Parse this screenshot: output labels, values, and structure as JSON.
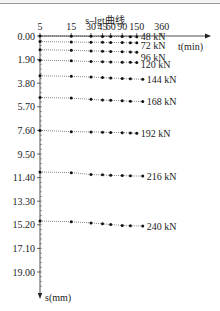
{
  "chart_data": {
    "type": "line",
    "title": "s–lgt曲线",
    "xlabel": "t(min)",
    "ylabel": "s(mm)",
    "x_scale": "log",
    "x_ticks": [
      5,
      15,
      30,
      45,
      60,
      90,
      150,
      360
    ],
    "x_tick_labels": [
      "5",
      "15",
      "30",
      "45",
      "60",
      "90",
      "150",
      "360"
    ],
    "y_ticks": [
      0.0,
      1.9,
      3.8,
      5.7,
      7.6,
      9.5,
      11.4,
      13.3,
      15.2,
      17.1,
      19.0
    ],
    "y_tick_labels": [
      "0.00",
      "1.90",
      "3.80",
      "5.70",
      "7.60",
      "9.50",
      "11.40",
      "13.30",
      "15.20",
      "17.10",
      "19.00"
    ],
    "ylim": [
      0,
      20.5
    ],
    "y_inverted": true,
    "grid": false,
    "x": [
      5,
      15,
      30,
      45,
      60,
      90,
      120,
      150
    ],
    "series": [
      {
        "name": "48 kN",
        "values": [
          0.0,
          0.02,
          0.03,
          0.04,
          0.05,
          0.05,
          0.06,
          0.06
        ]
      },
      {
        "name": "72 kN",
        "values": [
          0.45,
          0.48,
          0.5,
          0.51,
          0.52,
          0.53,
          0.54,
          0.55
        ]
      },
      {
        "name": "96 kN",
        "values": [
          1.1,
          1.15,
          1.2,
          1.22,
          1.24,
          1.26,
          1.28,
          1.3
        ]
      },
      {
        "name": "120 kN",
        "values": [
          1.95,
          2.0,
          2.05,
          2.07,
          2.09,
          2.11,
          2.12,
          2.14
        ]
      },
      {
        "name": "144 kN",
        "values": [
          3.2,
          3.25,
          3.3,
          3.35,
          3.38,
          3.42,
          3.45,
          3.48
        ]
      },
      {
        "name": "168 kN",
        "values": [
          4.95,
          5.0,
          5.1,
          5.15,
          5.18,
          5.22,
          5.25,
          5.28
        ]
      },
      {
        "name": "192 kN",
        "values": [
          7.6,
          7.7,
          7.72,
          7.74,
          7.76,
          7.78,
          7.8,
          7.82
        ]
      },
      {
        "name": "216 kN",
        "values": [
          10.95,
          11.0,
          11.15,
          11.18,
          11.22,
          11.24,
          11.26,
          11.28
        ]
      },
      {
        "name": "240 kN",
        "values": [
          14.9,
          14.95,
          15.05,
          15.12,
          15.18,
          15.25,
          15.28,
          15.3
        ]
      }
    ]
  }
}
